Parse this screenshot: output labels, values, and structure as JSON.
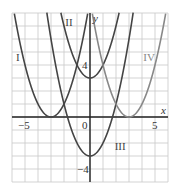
{
  "chart_data": {
    "type": "line",
    "title": "",
    "xlabel": "x",
    "ylabel": "y",
    "xlim": [
      -6,
      6
    ],
    "ylim": [
      -5,
      8
    ],
    "grid": true,
    "x_tick_labels": [
      {
        "value": -5,
        "label": "−5"
      },
      {
        "value": 0,
        "label": "0"
      },
      {
        "value": 5,
        "label": "5"
      }
    ],
    "y_tick_labels": [
      {
        "value": 4,
        "label": "4"
      },
      {
        "value": -4,
        "label": "−4"
      }
    ],
    "series": [
      {
        "name": "I",
        "equation": "y = (x + 3)^2",
        "vertex": [
          -3,
          0
        ],
        "a": 1,
        "h": -3,
        "k": 0,
        "color": "#444444",
        "label_pos": [
          -5.7,
          4.3
        ]
      },
      {
        "name": "II",
        "equation": "y = x^2 + 3",
        "vertex": [
          0,
          3
        ],
        "a": 1,
        "h": 0,
        "k": 3,
        "color": "#444444",
        "label_pos": [
          -1.9,
          7.0
        ]
      },
      {
        "name": "III",
        "equation": "y = x^2 - 3",
        "vertex": [
          0,
          -3
        ],
        "a": 1,
        "h": 0,
        "k": -3,
        "color": "#444444",
        "label_pos": [
          1.9,
          -2.5
        ]
      },
      {
        "name": "IV",
        "equation": "y = (x - 3)^2",
        "vertex": [
          3,
          0
        ],
        "a": 1,
        "h": 3,
        "k": 0,
        "color": "#888888",
        "label_pos": [
          4.1,
          4.3
        ]
      }
    ]
  },
  "colors": {
    "grid": "#c8c8c8",
    "axis": "#222222",
    "text": "#333333",
    "background": "#ffffff"
  }
}
